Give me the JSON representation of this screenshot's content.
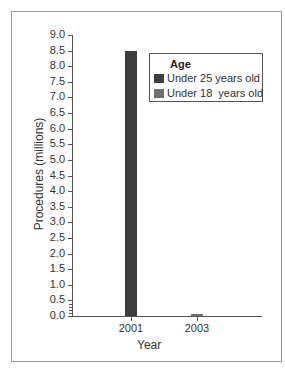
{
  "chart_data": {
    "type": "bar",
    "title": "",
    "xlabel": "Year",
    "ylabel": "Procedures (millions)",
    "categories": [
      "2001",
      "2003"
    ],
    "series": [
      {
        "name": "Under 25 years old",
        "color": "#3d3d3d",
        "values": [
          8.5,
          null
        ]
      },
      {
        "name": "Under 18  years old",
        "color": "#6e6e6e",
        "values": [
          null,
          0.07
        ]
      }
    ],
    "ylim": [
      0,
      9.0
    ],
    "yticks": [
      "9.0",
      "8.5",
      "8.0",
      "7.5",
      "7.0",
      "6.5",
      "6.0",
      "5.5",
      "5.0",
      "4.5",
      "4.0",
      "3.5",
      "3.0",
      "2.5",
      "2.0",
      "1.5",
      "1.0",
      "0.5",
      "0.0"
    ],
    "grid": false,
    "legend": {
      "title": "Age",
      "position": "upper right"
    }
  },
  "legend": {
    "title": "Age",
    "items": [
      {
        "label": "Under 25 years old",
        "color": "#3d3d3d"
      },
      {
        "label": "Under 18  years old",
        "color": "#6e6e6e"
      }
    ]
  },
  "axes": {
    "xlabel": "Year",
    "ylabel": "Procedures (millions)",
    "xcats": [
      "2001",
      "2003"
    ]
  }
}
